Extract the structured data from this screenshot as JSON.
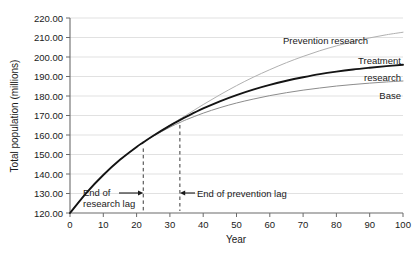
{
  "chart_data": {
    "type": "line",
    "title": "",
    "xlabel": "Year",
    "ylabel": "Total population (millions)",
    "xlim": [
      0,
      100
    ],
    "ylim": [
      120.0,
      220.0
    ],
    "grid": true,
    "grid_axis": "y",
    "legend_position": "inline-right-end-of-line",
    "x_ticks": [
      0,
      10,
      20,
      30,
      40,
      50,
      60,
      70,
      80,
      90,
      100
    ],
    "x_tick_labels": [
      "0",
      "10",
      "20",
      "30",
      "40",
      "50",
      "60",
      "70",
      "80",
      "90",
      "100"
    ],
    "y_ticks": [
      120,
      130,
      140,
      150,
      160,
      170,
      180,
      190,
      200,
      210,
      220
    ],
    "y_tick_labels": [
      "120.00",
      "130.00",
      "140.00",
      "150.00",
      "160.00",
      "170.00",
      "180.00",
      "190.00",
      "200.00",
      "210.00",
      "220.00"
    ],
    "x": [
      0,
      5,
      10,
      15,
      20,
      22,
      25,
      30,
      33,
      35,
      40,
      45,
      50,
      55,
      60,
      65,
      70,
      75,
      80,
      85,
      90,
      95,
      100
    ],
    "series": [
      {
        "name": "Base",
        "label": "Base",
        "color": "#8c8c8c",
        "width": 1.0,
        "style": "solid",
        "values": [
          120.0,
          130.5,
          139.5,
          147.3,
          153.9,
          156.2,
          159.4,
          164.0,
          166.4,
          167.9,
          171.2,
          174.0,
          176.4,
          178.4,
          180.2,
          181.7,
          183.0,
          184.1,
          185.1,
          185.9,
          186.6,
          187.2,
          187.7
        ]
      },
      {
        "name": "Treatment research",
        "label": "Treatment research",
        "color": "#141414",
        "width": 1.9,
        "style": "solid",
        "values": [
          120.0,
          130.5,
          139.5,
          147.3,
          153.9,
          156.2,
          159.6,
          164.8,
          167.6,
          169.4,
          173.6,
          177.3,
          180.5,
          183.3,
          185.7,
          187.8,
          189.6,
          191.2,
          192.5,
          193.6,
          194.5,
          195.3,
          196.0
        ]
      },
      {
        "name": "Prevention research",
        "label": "Prevention research",
        "color": "#b0b0b0",
        "width": 1.0,
        "style": "solid",
        "values": [
          120.0,
          130.5,
          139.5,
          147.3,
          153.9,
          156.2,
          159.6,
          165.0,
          168.2,
          170.3,
          175.6,
          180.6,
          185.3,
          189.6,
          193.5,
          197.1,
          200.3,
          203.2,
          205.7,
          207.9,
          209.8,
          211.4,
          212.7
        ]
      }
    ],
    "annotations": [
      {
        "id": "end-of-research-lag",
        "text": "End of research lag",
        "text_lines": [
          "End of",
          "research lag"
        ],
        "marker_x": 22,
        "arrow_direction": "right",
        "vline_x": 22,
        "vline_y_top": 156.2,
        "vline_style": "dashed",
        "label_y": 129.5
      },
      {
        "id": "end-of-prevention-lag",
        "text": "End of prevention lag",
        "text_lines": [
          "End of prevention lag"
        ],
        "marker_x": 33,
        "arrow_direction": "left",
        "vline_x": 33,
        "vline_y_top": 168.2,
        "vline_style": "dashed",
        "label_y": 129.5
      }
    ]
  },
  "axes": {
    "y_title": "Total population (millions)",
    "x_title": "Year",
    "y_labels": {
      "t220": "220.00",
      "t210": "210.00",
      "t200": "200.00",
      "t190": "190.00",
      "t180": "180.00",
      "t170": "170.00",
      "t160": "160.00",
      "t150": "150.00",
      "t140": "140.00",
      "t130": "130.00",
      "t120": "120.00"
    },
    "x_labels": {
      "t0": "0",
      "t10": "10",
      "t20": "20",
      "t30": "30",
      "t40": "40",
      "t50": "50",
      "t60": "60",
      "t70": "70",
      "t80": "80",
      "t90": "90",
      "t100": "100"
    }
  },
  "series_labels": {
    "prevention": "Prevention research",
    "treatment_line1": "Treatment",
    "treatment_line2": "research",
    "base": "Base"
  },
  "annotation_labels": {
    "research_lag_line1": "End of",
    "research_lag_line2": "research lag",
    "prevention_lag": "End of prevention lag"
  },
  "colors": {
    "base": "#8c8c8c",
    "treatment": "#141414",
    "prevention": "#b0b0b0",
    "grid": "#d9d9d9",
    "axis": "#6b6b6b",
    "text": "#1a1a1a"
  }
}
